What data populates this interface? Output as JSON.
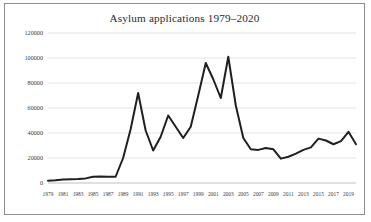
{
  "chart_data": {
    "type": "line",
    "title": "Asylum applications 1979–2020",
    "xlabel": "",
    "ylabel": "",
    "grid": true,
    "legend": false,
    "ylim": [
      0,
      120000
    ],
    "ytick_labels": [
      "0",
      "20000",
      "40000",
      "60000",
      "80000",
      "100000",
      "120000"
    ],
    "ytick_values": [
      0,
      20000,
      40000,
      60000,
      80000,
      100000,
      120000
    ],
    "xtick_labels": [
      "1979",
      "1981",
      "1983",
      "1985",
      "1987",
      "1989",
      "1991",
      "1993",
      "1995",
      "1997",
      "1999",
      "2001",
      "2003",
      "2005",
      "2007",
      "2009",
      "2011",
      "2013",
      "2015",
      "2017",
      "2019"
    ],
    "xlim": [
      1979,
      2020
    ],
    "x": [
      1979,
      1980,
      1981,
      1982,
      1983,
      1984,
      1985,
      1986,
      1987,
      1988,
      1989,
      1990,
      1991,
      1992,
      1993,
      1994,
      1995,
      1996,
      1997,
      1998,
      1999,
      2000,
      2001,
      2002,
      2003,
      2004,
      2005,
      2006,
      2007,
      2008,
      2009,
      2010,
      2011,
      2012,
      2013,
      2014,
      2015,
      2016,
      2017,
      2018,
      2019,
      2020
    ],
    "values": [
      1800,
      2200,
      2800,
      3100,
      3300,
      3700,
      5000,
      5200,
      5000,
      5000,
      20000,
      43000,
      72000,
      42000,
      26000,
      37000,
      54000,
      45000,
      36000,
      45000,
      70000,
      96000,
      83000,
      68000,
      101000,
      62000,
      36000,
      27000,
      26500,
      28000,
      27000,
      19500,
      21000,
      23500,
      26500,
      28500,
      35500,
      34000,
      31000,
      33500,
      41000,
      31000
    ],
    "line_color": "#231f20",
    "grid_color": "#d9d9d9"
  },
  "frame": {
    "border_color": "#8d8d8d",
    "background": "#ffffff"
  }
}
